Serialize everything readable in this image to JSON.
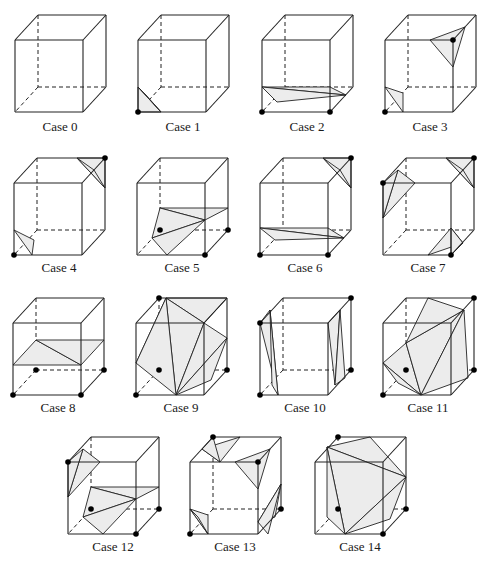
{
  "figure": {
    "fill_color": "#ececec",
    "line_color": "#222222"
  },
  "cases": [
    {
      "label": "Case 0",
      "ox": 15,
      "oy": 15,
      "lx": 10,
      "ly": 119,
      "marked": [],
      "tris": []
    },
    {
      "label": "Case 1",
      "ox": 138,
      "oy": 15,
      "lx": 133,
      "ly": 119,
      "marked": [
        "FBL"
      ],
      "tris": [
        [
          [
            0,
            72
          ],
          [
            23,
            97
          ],
          [
            0,
            97
          ]
        ],
        [
          [
            0,
            72
          ],
          [
            8,
            80
          ],
          [
            23,
            97
          ]
        ]
      ]
    },
    {
      "label": "Case 2",
      "ox": 262,
      "oy": 15,
      "lx": 257,
      "ly": 119,
      "marked": [
        "FBL",
        "FBR"
      ],
      "tris": [
        [
          [
            0,
            72
          ],
          [
            68,
            72
          ],
          [
            84,
            80
          ]
        ],
        [
          [
            0,
            72
          ],
          [
            84,
            80
          ],
          [
            15,
            87
          ]
        ]
      ]
    },
    {
      "label": "Case 3",
      "ox": 385,
      "oy": 15,
      "lx": 380,
      "ly": 119,
      "marked": [
        "FBL",
        "FTR"
      ],
      "tris": [
        [
          [
            0,
            72
          ],
          [
            18,
            78
          ],
          [
            18,
            97
          ]
        ],
        [
          [
            45,
            25
          ],
          [
            80,
            12
          ],
          [
            68,
            52
          ]
        ]
      ]
    },
    {
      "label": "Case 4",
      "ox": 14,
      "oy": 158,
      "lx": 9,
      "ly": 260,
      "marked": [
        "FBL",
        "BTR"
      ],
      "tris": [
        [
          [
            0,
            72
          ],
          [
            20,
            82
          ],
          [
            18,
            97
          ]
        ],
        [
          [
            63,
            0
          ],
          [
            91,
            0
          ],
          [
            91,
            30
          ]
        ],
        [
          [
            63,
            0
          ],
          [
            80,
            12
          ],
          [
            91,
            30
          ]
        ]
      ]
    },
    {
      "label": "Case 5",
      "ox": 137,
      "oy": 158,
      "lx": 132,
      "ly": 260,
      "marked": [
        "FBR",
        "BBR",
        "BBL"
      ],
      "tris": [
        [
          [
            23,
            50
          ],
          [
            91,
            50
          ],
          [
            68,
            62
          ]
        ],
        [
          [
            23,
            50
          ],
          [
            68,
            62
          ],
          [
            15,
            80
          ]
        ],
        [
          [
            15,
            80
          ],
          [
            68,
            62
          ],
          [
            30,
            97
          ]
        ]
      ]
    },
    {
      "label": "Case 6",
      "ox": 260,
      "oy": 158,
      "lx": 255,
      "ly": 260,
      "marked": [
        "FBL",
        "FBR",
        "BTR"
      ],
      "tris": [
        [
          [
            0,
            70
          ],
          [
            68,
            70
          ],
          [
            84,
            80
          ]
        ],
        [
          [
            0,
            70
          ],
          [
            84,
            80
          ],
          [
            15,
            82
          ]
        ],
        [
          [
            63,
            0
          ],
          [
            91,
            0
          ],
          [
            91,
            30
          ]
        ],
        [
          [
            63,
            0
          ],
          [
            80,
            12
          ],
          [
            91,
            30
          ]
        ]
      ]
    },
    {
      "label": "Case 7",
      "ox": 383,
      "oy": 158,
      "lx": 378,
      "ly": 260,
      "marked": [
        "FTL",
        "BTR",
        "FBR"
      ],
      "tris": [
        [
          [
            0,
            60
          ],
          [
            15,
            12
          ],
          [
            32,
            25
          ]
        ],
        [
          [
            0,
            25
          ],
          [
            15,
            12
          ],
          [
            0,
            60
          ]
        ],
        [
          [
            63,
            0
          ],
          [
            91,
            0
          ],
          [
            91,
            30
          ]
        ],
        [
          [
            63,
            0
          ],
          [
            80,
            12
          ],
          [
            91,
            30
          ]
        ],
        [
          [
            68,
            70
          ],
          [
            45,
            97
          ],
          [
            80,
            85
          ]
        ],
        [
          [
            68,
            70
          ],
          [
            80,
            85
          ],
          [
            68,
            97
          ]
        ]
      ]
    },
    {
      "label": "Case 8",
      "ox": 13,
      "oy": 298,
      "lx": 8,
      "ly": 400,
      "marked": [
        "FBL",
        "FBR",
        "BBL",
        "BBR"
      ],
      "tris": [
        [
          [
            0,
            67
          ],
          [
            23,
            42
          ],
          [
            68,
            67
          ]
        ],
        [
          [
            23,
            42
          ],
          [
            91,
            42
          ],
          [
            68,
            67
          ]
        ]
      ]
    },
    {
      "label": "Case 9",
      "ox": 136,
      "oy": 298,
      "lx": 131,
      "ly": 400,
      "marked": [
        "FBL",
        "BBL",
        "BTL",
        "BBR"
      ],
      "tris": [
        [
          [
            0,
            65
          ],
          [
            30,
            0
          ],
          [
            40,
            25
          ]
        ],
        [
          [
            0,
            65
          ],
          [
            40,
            25
          ],
          [
            68,
            25
          ]
        ],
        [
          [
            30,
            0
          ],
          [
            91,
            0
          ],
          [
            68,
            25
          ]
        ],
        [
          [
            40,
            97
          ],
          [
            30,
            0
          ],
          [
            68,
            25
          ]
        ],
        [
          [
            40,
            97
          ],
          [
            68,
            25
          ],
          [
            91,
            40
          ]
        ],
        [
          [
            40,
            97
          ],
          [
            91,
            40
          ],
          [
            75,
            82
          ]
        ],
        [
          [
            40,
            97
          ],
          [
            0,
            65
          ],
          [
            30,
            0
          ]
        ]
      ]
    },
    {
      "label": "Case 10",
      "ox": 260,
      "oy": 298,
      "lx": 255,
      "ly": 400,
      "marked": [
        "FTL",
        "FBL",
        "BTR",
        "BBR"
      ],
      "tris": [
        [
          [
            0,
            25
          ],
          [
            10,
            12
          ],
          [
            18,
            97
          ]
        ],
        [
          [
            10,
            12
          ],
          [
            18,
            97
          ],
          [
            12,
            87
          ]
        ],
        [
          [
            68,
            25
          ],
          [
            80,
            12
          ],
          [
            75,
            87
          ]
        ],
        [
          [
            80,
            12
          ],
          [
            75,
            87
          ],
          [
            85,
            80
          ]
        ]
      ]
    },
    {
      "label": "Case 11",
      "ox": 383,
      "oy": 298,
      "lx": 378,
      "ly": 400,
      "marked": [
        "FBL",
        "BBL",
        "BTR",
        "BBR"
      ],
      "tris": [
        [
          [
            0,
            65
          ],
          [
            23,
            45
          ],
          [
            38,
            97
          ]
        ],
        [
          [
            23,
            45
          ],
          [
            38,
            97
          ],
          [
            81,
            12
          ]
        ],
        [
          [
            23,
            45
          ],
          [
            45,
            0
          ],
          [
            81,
            12
          ]
        ],
        [
          [
            38,
            97
          ],
          [
            81,
            12
          ],
          [
            85,
            80
          ]
        ],
        [
          [
            0,
            65
          ],
          [
            38,
            97
          ],
          [
            15,
            85
          ]
        ]
      ]
    },
    {
      "label": "Case 12",
      "ox": 68,
      "oy": 437,
      "lx": 63,
      "ly": 539,
      "marked": [
        "FTL",
        "BBL",
        "BBR",
        "FBR"
      ],
      "tris": [
        [
          [
            0,
            60
          ],
          [
            15,
            12
          ],
          [
            32,
            25
          ]
        ],
        [
          [
            0,
            25
          ],
          [
            15,
            12
          ],
          [
            0,
            60
          ]
        ],
        [
          [
            23,
            50
          ],
          [
            91,
            50
          ],
          [
            68,
            62
          ]
        ],
        [
          [
            23,
            50
          ],
          [
            68,
            62
          ],
          [
            15,
            80
          ]
        ],
        [
          [
            15,
            80
          ],
          [
            68,
            62
          ],
          [
            35,
            97
          ]
        ]
      ]
    },
    {
      "label": "Case 13",
      "ox": 190,
      "oy": 437,
      "lx": 185,
      "ly": 539,
      "marked": [
        "BTL",
        "FTR",
        "FBL",
        "BBR"
      ],
      "tris": [
        [
          [
            12,
            12
          ],
          [
            50,
            0
          ],
          [
            30,
            25
          ]
        ],
        [
          [
            12,
            12
          ],
          [
            30,
            25
          ],
          [
            23,
            0
          ]
        ],
        [
          [
            45,
            25
          ],
          [
            80,
            12
          ],
          [
            68,
            52
          ]
        ],
        [
          [
            0,
            72
          ],
          [
            18,
            78
          ],
          [
            18,
            97
          ]
        ],
        [
          [
            0,
            72
          ],
          [
            8,
            80
          ],
          [
            18,
            97
          ]
        ],
        [
          [
            68,
            85
          ],
          [
            91,
            47
          ],
          [
            85,
            80
          ]
        ],
        [
          [
            68,
            85
          ],
          [
            78,
            97
          ],
          [
            91,
            47
          ]
        ]
      ]
    },
    {
      "label": "Case 14",
      "ox": 315,
      "oy": 437,
      "lx": 310,
      "ly": 539,
      "marked": [
        "BTL",
        "BBL",
        "FBR",
        "BBR"
      ],
      "tris": [
        [
          [
            12,
            10
          ],
          [
            55,
            0
          ],
          [
            91,
            40
          ]
        ],
        [
          [
            12,
            10
          ],
          [
            91,
            40
          ],
          [
            30,
            97
          ]
        ],
        [
          [
            12,
            10
          ],
          [
            30,
            97
          ],
          [
            12,
            80
          ]
        ],
        [
          [
            30,
            97
          ],
          [
            91,
            40
          ],
          [
            75,
            82
          ]
        ]
      ]
    }
  ]
}
